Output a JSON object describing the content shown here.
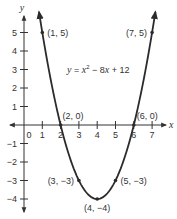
{
  "chart_data": {
    "type": "line",
    "title": "",
    "equation": {
      "lhs": "y",
      "eq_sign": " = ",
      "x_var": "x",
      "exponent": "2",
      "rest_prefix": " − 8",
      "x_var2": "x",
      "rest_suffix": " + 12",
      "full_text": "y = x² − 8x + 12"
    },
    "xlabel": "x",
    "ylabel": "y",
    "xlim": [
      -1,
      7.5
    ],
    "ylim": [
      -4.5,
      6
    ],
    "grid": false,
    "x_ticks": [
      {
        "value": 0,
        "label": "0"
      },
      {
        "value": 1,
        "label": "1"
      },
      {
        "value": 2,
        "label": "2"
      },
      {
        "value": 3,
        "label": "3"
      },
      {
        "value": 4,
        "label": "4"
      },
      {
        "value": 5,
        "label": "5"
      },
      {
        "value": 6,
        "label": "6"
      },
      {
        "value": 7,
        "label": "7"
      }
    ],
    "y_ticks": [
      {
        "value": 5,
        "label": "5"
      },
      {
        "value": 4,
        "label": "4"
      },
      {
        "value": 3,
        "label": "3"
      },
      {
        "value": 2,
        "label": "2"
      },
      {
        "value": 1,
        "label": "1"
      },
      {
        "value": -1,
        "label": "−1"
      },
      {
        "value": -2,
        "label": "−2"
      },
      {
        "value": -3,
        "label": "−3"
      },
      {
        "value": -4,
        "label": "−4"
      }
    ],
    "series": [
      {
        "name": "y = x^2 - 8x + 12",
        "x": [
          1,
          2,
          3,
          4,
          5,
          6,
          7
        ],
        "y": [
          5,
          0,
          -3,
          -4,
          -3,
          0,
          5
        ]
      }
    ],
    "labeled_points": [
      {
        "x": 1,
        "y": 5,
        "label": "(1, 5)"
      },
      {
        "x": 7,
        "y": 5,
        "label": "(7, 5)"
      },
      {
        "x": 2,
        "y": 0,
        "label": "(2, 0)"
      },
      {
        "x": 6,
        "y": 0,
        "label": "(6, 0)"
      },
      {
        "x": 3,
        "y": -3,
        "label": "(3, −3)"
      },
      {
        "x": 5,
        "y": -3,
        "label": "(5, −3)"
      },
      {
        "x": 4,
        "y": -4,
        "label": "(4, −4)"
      }
    ],
    "colors": {
      "curve": "#2b2b2b",
      "axes": "#333333",
      "text": "#333333"
    }
  }
}
